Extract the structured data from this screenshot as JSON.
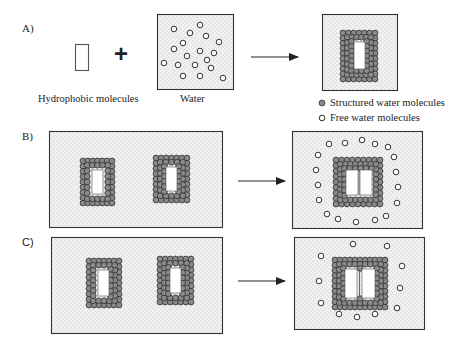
{
  "colors": {
    "stroke": "#333333",
    "box_fill": "#efefef",
    "dot": "#b8b8b8",
    "structured_fill": "#8a8a8a",
    "structured_stroke": "#3a3a3a",
    "free_stroke": "#333333",
    "free_fill": "#ffffff"
  },
  "panels": {
    "A": {
      "label": "A)",
      "hydrophobic_label": "Hydrophobic molecules",
      "water_label": "Water",
      "plus": "+",
      "hydrophobic_rect": {
        "x": 75,
        "y": 44,
        "w": 13,
        "h": 26
      },
      "water_box": {
        "x": 157,
        "y": 14,
        "w": 76,
        "h": 75
      },
      "water_free": [
        [
          174,
          29
        ],
        [
          200,
          25
        ],
        [
          190,
          33
        ],
        [
          206,
          36
        ],
        [
          183,
          43
        ],
        [
          219,
          42
        ],
        [
          174,
          49
        ],
        [
          200,
          51
        ],
        [
          214,
          53
        ],
        [
          187,
          56
        ],
        [
          164,
          63
        ],
        [
          178,
          65
        ],
        [
          195,
          65
        ],
        [
          207,
          60
        ],
        [
          211,
          68
        ],
        [
          183,
          76
        ],
        [
          200,
          76
        ],
        [
          223,
          78
        ]
      ],
      "arrow": {
        "x1": 251,
        "x2": 298,
        "y": 57
      },
      "result_box": {
        "x": 322,
        "y": 14,
        "w": 75,
        "h": 76
      },
      "result_cluster": {
        "x": 340,
        "y": 30,
        "w": 38,
        "h": 52,
        "inner": [
          [
            354,
            42,
            11,
            27
          ]
        ]
      }
    },
    "legend": {
      "structured": "Structured water molecules",
      "free": "Free water molecules"
    },
    "B": {
      "label": "B)",
      "left_box": {
        "x": 49,
        "y": 131,
        "w": 173,
        "h": 96
      },
      "left_clusters": [
        {
          "x": 80,
          "y": 158,
          "w": 35,
          "h": 48,
          "inner": [
            [
              92,
              170,
              11,
              24
            ]
          ]
        },
        {
          "x": 153,
          "y": 155,
          "w": 37,
          "h": 48,
          "inner": [
            [
              166,
              167,
              11,
              24
            ]
          ]
        }
      ],
      "arrow": {
        "x1": 238,
        "x2": 285,
        "y": 181
      },
      "right_box": {
        "x": 292,
        "y": 131,
        "w": 130,
        "h": 97
      },
      "right_cluster": {
        "x": 333,
        "y": 157,
        "w": 50,
        "h": 50,
        "inner": [
          [
            346,
            170,
            12,
            25
          ],
          [
            360,
            170,
            12,
            25
          ]
        ]
      },
      "right_free": [
        [
          329,
          144
        ],
        [
          345,
          143
        ],
        [
          362,
          140
        ],
        [
          375,
          144
        ],
        [
          388,
          147
        ],
        [
          318,
          155
        ],
        [
          394,
          157
        ],
        [
          316,
          170
        ],
        [
          396,
          172
        ],
        [
          318,
          185
        ],
        [
          398,
          187
        ],
        [
          319,
          200
        ],
        [
          397,
          203
        ],
        [
          327,
          214
        ],
        [
          338,
          219
        ],
        [
          356,
          222
        ],
        [
          375,
          220
        ],
        [
          386,
          216
        ]
      ]
    },
    "C": {
      "label": "C)",
      "left_box": {
        "x": 51,
        "y": 237,
        "w": 171,
        "h": 96
      },
      "left_clusters": [
        {
          "x": 86,
          "y": 258,
          "w": 36,
          "h": 50,
          "inner": [
            [
              98,
              270,
              11,
              26
            ]
          ]
        },
        {
          "x": 157,
          "y": 256,
          "w": 37,
          "h": 49,
          "inner": [
            [
              170,
              268,
              11,
              25
            ]
          ]
        }
      ],
      "arrow": {
        "x1": 238,
        "x2": 285,
        "y": 281
      },
      "right_box": {
        "x": 294,
        "y": 237,
        "w": 130,
        "h": 92
      },
      "right_cluster": {
        "x": 332,
        "y": 257,
        "w": 56,
        "h": 53,
        "inner": [
          [
            345,
            269,
            12,
            29
          ],
          [
            362,
            269,
            13,
            29
          ]
        ]
      },
      "right_free": [
        [
          353,
          244
        ],
        [
          387,
          246
        ],
        [
          321,
          256
        ],
        [
          402,
          266
        ],
        [
          319,
          281
        ],
        [
          400,
          288
        ],
        [
          321,
          303
        ],
        [
          397,
          308
        ],
        [
          339,
          314
        ],
        [
          357,
          317
        ],
        [
          375,
          314
        ]
      ]
    }
  }
}
